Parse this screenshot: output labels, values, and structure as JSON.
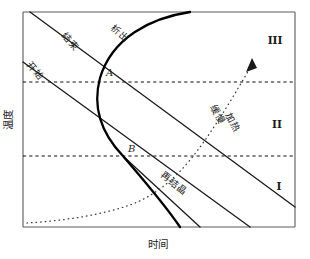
{
  "figure": {
    "type": "diagram",
    "kind": "ttt-schematic-phase-diagram",
    "axes": {
      "y_label": "温度",
      "x_label": "时间",
      "y_label_orientation": "vertical",
      "frame": {
        "left": 23,
        "top": 12,
        "right": 295,
        "bottom": 227
      }
    },
    "curve_labels": [
      {
        "name": "jieshu",
        "text": "结束",
        "x": 68,
        "y": 44,
        "rotation": 48
      },
      {
        "name": "xichu",
        "text": "析出",
        "x": 118,
        "y": 36,
        "rotation": 40
      },
      {
        "name": "kaishi",
        "text": "开始",
        "x": 33,
        "y": 73,
        "rotation": 50
      },
      {
        "name": "zaijiejing",
        "text": "再结晶",
        "x": 172,
        "y": 186,
        "rotation": 38
      },
      {
        "name": "huanman",
        "text": "缓慢",
        "x": 215,
        "y": 116,
        "rotation": 62
      },
      {
        "name": "jiare",
        "text": "加热",
        "x": 228,
        "y": 124,
        "rotation": 62
      }
    ],
    "point_labels": [
      {
        "name": "point-a",
        "text": "A",
        "x": 106,
        "y": 76
      },
      {
        "name": "point-b",
        "text": "B",
        "x": 128,
        "y": 152
      }
    ],
    "region_labels": [
      {
        "name": "region-three",
        "text": "III",
        "x": 275,
        "y": 44
      },
      {
        "name": "region-two",
        "text": "II",
        "x": 277,
        "y": 128
      },
      {
        "name": "region-one",
        "text": "I",
        "x": 279,
        "y": 190
      }
    ],
    "dashed_lines": [
      {
        "name": "isotherm-upper",
        "y": 82
      },
      {
        "name": "isotherm-lower",
        "y": 156
      }
    ],
    "colors": {
      "frame": "#5a5a5a",
      "curve": "#1a1a1a",
      "curve_bold": "#000000",
      "dashed": "#111111",
      "dotted": "#3a3a3a",
      "text": "#1c1c1c",
      "background": "#ffffff"
    }
  }
}
